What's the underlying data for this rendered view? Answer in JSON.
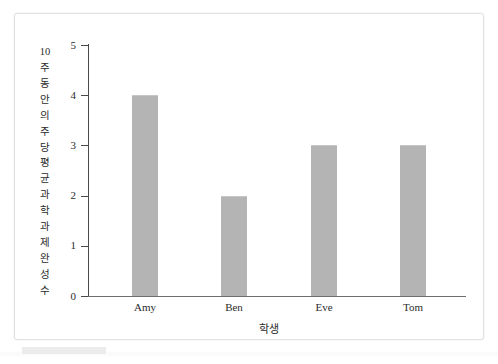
{
  "chart_data": {
    "type": "bar",
    "title": "",
    "categories": [
      "Amy",
      "Ben",
      "Eve",
      "Tom"
    ],
    "values": [
      4,
      2,
      3,
      3
    ],
    "xlabel": "학생",
    "ylabel": "10주 동안의 주당 평균 과학과제 완성 수",
    "ylim": [
      0,
      5
    ],
    "ytick_labels": [
      "5",
      "4",
      "3",
      "2",
      "1",
      "0"
    ],
    "ytick_values": [
      5,
      4,
      3,
      2,
      1,
      0
    ],
    "grid": false,
    "legend": null,
    "bar_color": "#b4b4b4",
    "axis_color": "#4a4a4a",
    "text_color": "#2b2b2b"
  },
  "axes": {
    "y_title_chars": [
      "10",
      "주",
      "동",
      "안",
      "의",
      "주",
      "당",
      "평",
      "균",
      "과",
      "학",
      "과",
      "제",
      "완",
      "성",
      "수"
    ],
    "x_title": "학생"
  },
  "frame": {
    "border_color": "#e2e2e2",
    "background": "#ffffff"
  }
}
